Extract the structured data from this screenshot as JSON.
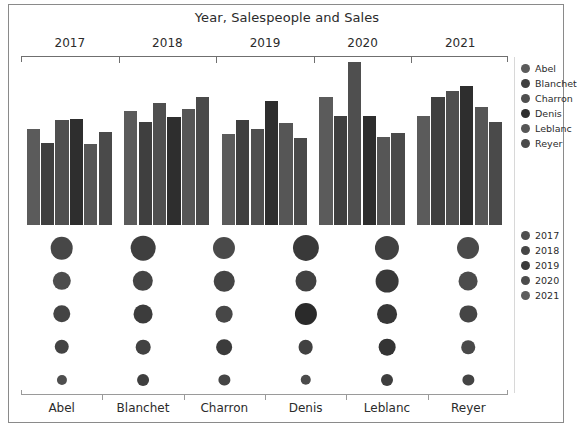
{
  "chart_data": {
    "type": "bar",
    "title": "Year, Salespeople and Sales",
    "xlabel": "",
    "ylabel": "",
    "grid": false,
    "top_axis_label": "Year",
    "bottom_axis_label": "Salespeople",
    "categories": [
      "2017",
      "2018",
      "2019",
      "2020",
      "2021"
    ],
    "salespeople": [
      "Abel",
      "Blanchet",
      "Charron",
      "Denis",
      "Leblanc",
      "Reyer"
    ],
    "series": [
      {
        "name": "Abel",
        "values": [
          77,
          92,
          73,
          103,
          88
        ]
      },
      {
        "name": "Blanchet",
        "values": [
          66,
          83,
          84,
          88,
          103
        ]
      },
      {
        "name": "Charron",
        "values": [
          84,
          98,
          77,
          131,
          108
        ]
      },
      {
        "name": "Denis",
        "values": [
          85,
          87,
          100,
          88,
          112
        ]
      },
      {
        "name": "Leblanc",
        "values": [
          65,
          93,
          82,
          71,
          95
        ]
      },
      {
        "name": "Reyer",
        "values": [
          75,
          103,
          70,
          74,
          83
        ]
      }
    ],
    "ylim": [
      0,
      131
    ],
    "dot_matrix": {
      "description": "Sales by salesperson and year, encoded as circle size and shade",
      "rows": [
        "2017",
        "2018",
        "2019",
        "2020",
        "2021"
      ],
      "columns": [
        "Abel",
        "Blanchet",
        "Charron",
        "Denis",
        "Leblanc",
        "Reyer"
      ],
      "values": [
        [
          77,
          92,
          73,
          103,
          88,
          72
        ],
        [
          66,
          83,
          84,
          88,
          103,
          70
        ],
        [
          84,
          98,
          77,
          131,
          108,
          82
        ],
        [
          85,
          87,
          100,
          88,
          112,
          74
        ],
        [
          65,
          93,
          82,
          71,
          95,
          83
        ]
      ]
    },
    "legend_people_position": "right-top",
    "legend_years_position": "right-middle"
  },
  "legends": {
    "people": {
      "items": [
        {
          "label": "Abel",
          "color": "#5b5b5b"
        },
        {
          "label": "Blanchet",
          "color": "#3f3f3f"
        },
        {
          "label": "Charron",
          "color": "#4f4f4f"
        },
        {
          "label": "Denis",
          "color": "#2e2e2e"
        },
        {
          "label": "Leblanc",
          "color": "#565656"
        },
        {
          "label": "Reyer",
          "color": "#4a4a4a"
        }
      ]
    },
    "years": {
      "items": [
        {
          "label": "2017",
          "color": "#4f4f4f"
        },
        {
          "label": "2018",
          "color": "#464646"
        },
        {
          "label": "2019",
          "color": "#3a3a3a"
        },
        {
          "label": "2020",
          "color": "#4c4c4c"
        },
        {
          "label": "2021",
          "color": "#5d5d5d"
        }
      ]
    }
  },
  "axes": {
    "top_ticks": [
      "2017",
      "2018",
      "2019",
      "2020",
      "2021"
    ],
    "bottom_ticks": [
      "Abel",
      "Blanchet",
      "Charron",
      "Denis",
      "Leblanc",
      "Reyer"
    ]
  },
  "colors": {
    "frame": "#8a8a8a",
    "axis": "#6f6f6f",
    "text": "#2b2b2b",
    "background": "#ffffff"
  }
}
